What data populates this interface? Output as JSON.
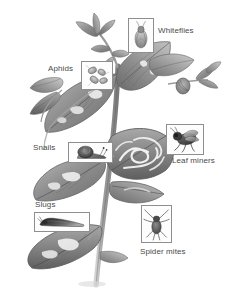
{
  "figure": {
    "style": "grayscale pencil drawing",
    "background_color": "#ffffff",
    "label_color": "#4a4a4a",
    "box_border_color": "#8e8e8e"
  },
  "callouts": [
    {
      "id": "whiteflies",
      "label": "Whiteflies",
      "icon_name": "whitefly-illustration",
      "box": {
        "x": 128,
        "y": 18,
        "w": 26,
        "h": 35
      },
      "label_pos": {
        "x": 158,
        "y": 26
      }
    },
    {
      "id": "aphids",
      "label": "Aphids",
      "icon_name": "aphid-illustration",
      "box": {
        "x": 81,
        "y": 61,
        "w": 32,
        "h": 29
      },
      "label_pos": {
        "x": 48,
        "y": 64
      }
    },
    {
      "id": "leaf-miners",
      "label": "Leaf miners",
      "icon_name": "leaf-miner-fly-illustration",
      "box": {
        "x": 166,
        "y": 124,
        "w": 38,
        "h": 31
      },
      "label_pos": {
        "x": 172,
        "y": 156
      }
    },
    {
      "id": "snails",
      "label": "Snails",
      "icon_name": "snail-illustration",
      "box": {
        "x": 68,
        "y": 142,
        "w": 45,
        "h": 21
      },
      "label_pos": {
        "x": 33,
        "y": 143
      }
    },
    {
      "id": "slugs",
      "label": "Slugs",
      "icon_name": "slug-illustration",
      "box": {
        "x": 34,
        "y": 212,
        "w": 56,
        "h": 20
      },
      "label_pos": {
        "x": 35,
        "y": 200
      }
    },
    {
      "id": "spider-mites",
      "label": "Spider mites",
      "icon_name": "spider-mite-illustration",
      "box": {
        "x": 141,
        "y": 205,
        "w": 31,
        "h": 38
      },
      "label_pos": {
        "x": 140,
        "y": 247
      }
    }
  ],
  "plant": {
    "description": "Upright plant stem with damaged leaves",
    "damage_notes": "Leaf-miner tunnels, chewed holes, discoloration"
  }
}
